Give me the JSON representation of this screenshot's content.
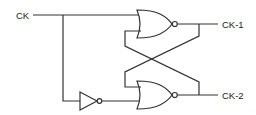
{
  "diagram": {
    "type": "logic-circuit",
    "labels": {
      "input": "CK",
      "output1": "CK-1",
      "output2": "CK-2"
    },
    "components": [
      {
        "id": "nor-top",
        "kind": "NOR gate",
        "output": "CK-1"
      },
      {
        "id": "nor-bottom",
        "kind": "NOR gate",
        "output": "CK-2"
      },
      {
        "id": "inverter",
        "kind": "NOT gate",
        "input": "CK"
      }
    ],
    "colors": {
      "line": "#333333",
      "background": "#ffffff"
    }
  }
}
